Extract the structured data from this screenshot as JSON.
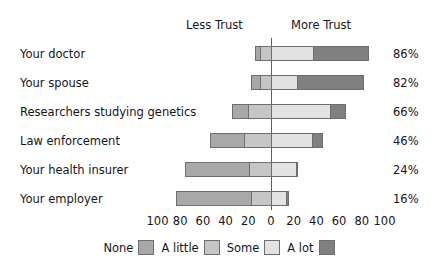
{
  "chart_data": {
    "type": "bar",
    "subtype": "diverging-stacked-bar",
    "title": "",
    "xlabel": "",
    "ylabel": "",
    "xlim": [
      -100,
      100
    ],
    "grid": false,
    "axis_note": "Percent, diverging about 0; left of zero = Less Trust, right of zero = More Trust",
    "headers": {
      "left": "Less Trust",
      "right": "More Trust"
    },
    "xticks": [
      {
        "label": "100",
        "value": -100
      },
      {
        "label": "80",
        "value": -80
      },
      {
        "label": "60",
        "value": -60
      },
      {
        "label": "40",
        "value": -40
      },
      {
        "label": "20",
        "value": -20
      },
      {
        "label": "0",
        "value": 0
      },
      {
        "label": "20",
        "value": 20
      },
      {
        "label": "40",
        "value": 40
      },
      {
        "label": "60",
        "value": 60
      },
      {
        "label": "80",
        "value": 80
      },
      {
        "label": "100",
        "value": 100
      }
    ],
    "legend": {
      "position": "bottom-center",
      "entries": [
        {
          "name": "None",
          "color": "#a8a8a8"
        },
        {
          "name": "A little",
          "color": "#c6c6c6"
        },
        {
          "name": "Some",
          "color": "#e2e2e2"
        },
        {
          "name": "A lot",
          "color": "#808080"
        }
      ]
    },
    "series": [
      {
        "name": "None",
        "color": "#a8a8a8",
        "values": [
          4,
          8,
          14,
          30,
          57,
          66
        ]
      },
      {
        "name": "A little",
        "color": "#c6c6c6",
        "values": [
          10,
          10,
          20,
          24,
          19,
          18
        ]
      },
      {
        "name": "Some",
        "color": "#e2e2e2",
        "values": [
          37,
          23,
          52,
          36,
          22,
          13
        ]
      },
      {
        "name": "A lot",
        "color": "#808080",
        "values": [
          49,
          59,
          14,
          10,
          2,
          3
        ]
      }
    ],
    "categories": [
      "Your doctor",
      "Your spouse",
      "Researchers studying genetics",
      "Law enforcement",
      "Your health insurer",
      "Your employer"
    ],
    "rows": [
      {
        "label": "Your doctor",
        "value_label": "86%",
        "none": 4,
        "a_little": 10,
        "some": 37,
        "a_lot": 49
      },
      {
        "label": "Your spouse",
        "value_label": "82%",
        "none": 8,
        "a_little": 10,
        "some": 23,
        "a_lot": 59
      },
      {
        "label": "Researchers studying genetics",
        "value_label": "66%",
        "none": 14,
        "a_little": 20,
        "some": 52,
        "a_lot": 14
      },
      {
        "label": "Law enforcement",
        "value_label": "46%",
        "none": 30,
        "a_little": 24,
        "some": 36,
        "a_lot": 10
      },
      {
        "label": "Your health insurer",
        "value_label": "24%",
        "none": 57,
        "a_little": 19,
        "some": 22,
        "a_lot": 2
      },
      {
        "label": "Your employer",
        "value_label": "16%",
        "none": 66,
        "a_little": 18,
        "some": 13,
        "a_lot": 3
      }
    ]
  },
  "style": {
    "bar_outline": "#6e6e72",
    "zero_line": "#5f5f63",
    "text": "#15151a",
    "background": "#ffffff"
  }
}
